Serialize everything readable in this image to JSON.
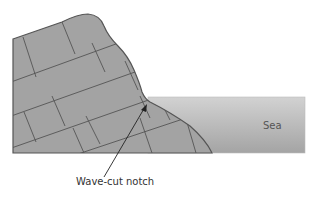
{
  "diagram": {
    "labels": {
      "sea": "Sea",
      "notch": "Wave-cut notch"
    },
    "colors": {
      "rock": "#a3a3a3",
      "rock_outline": "#555555",
      "sea_top": "#cfcfcf",
      "sea_bottom": "#a6a6a6",
      "arrow": "#222222"
    }
  }
}
